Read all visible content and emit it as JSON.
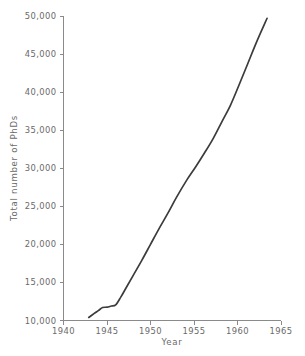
{
  "chart_data": {
    "type": "line",
    "title": "",
    "subtitle": "",
    "xlabel": "Year",
    "ylabel": "Total number of PhDs",
    "xlim": [
      1940,
      1965
    ],
    "ylim": [
      10000,
      50000
    ],
    "xticks": [
      1940,
      1945,
      1950,
      1955,
      1960,
      1965
    ],
    "xtick_labels": [
      "1940",
      "1945",
      "1950",
      "1955",
      "1960",
      "1965"
    ],
    "yticks": [
      10000,
      15000,
      20000,
      25000,
      30000,
      35000,
      40000,
      45000,
      50000
    ],
    "ytick_labels": [
      "10,000",
      "15,000",
      "20,000",
      "25,000",
      "30,000",
      "35,000",
      "40,000",
      "45,000",
      "50,000"
    ],
    "grid": false,
    "legend": false,
    "legend_position": "none",
    "line_color": "#3c3c3c",
    "axis_color": "#8a8a8a",
    "text_color": "#6a6a6a",
    "background_color": "#ffffff",
    "annotations": [],
    "x": [
      1942.9,
      1943.5,
      1944.0,
      1944.5,
      1945.0,
      1945.5,
      1946.0,
      1946.6,
      1947.2,
      1948.0,
      1949.0,
      1950.0,
      1951.0,
      1952.0,
      1953.0,
      1954.2,
      1955.2,
      1956.2,
      1957.2,
      1958.2,
      1959.2,
      1960.2,
      1961.2,
      1962.2,
      1963.4
    ],
    "values": [
      10400,
      10900,
      11300,
      11700,
      11750,
      11900,
      12050,
      13100,
      14300,
      15900,
      17900,
      20000,
      22100,
      24100,
      26200,
      28500,
      30200,
      32000,
      33900,
      36100,
      38300,
      41000,
      43800,
      46600,
      49700
    ],
    "series": [
      {
        "name": "Total number of PhDs",
        "values": [
          10400,
          10900,
          11300,
          11700,
          11750,
          11900,
          12050,
          13100,
          14300,
          15900,
          17900,
          20000,
          22100,
          24100,
          26200,
          28500,
          30200,
          32000,
          33900,
          36100,
          38300,
          41000,
          43800,
          46600,
          49700
        ]
      }
    ]
  }
}
